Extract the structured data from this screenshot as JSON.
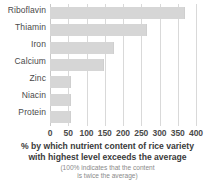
{
  "chart_data": {
    "type": "bar",
    "orientation": "horizontal",
    "title": "",
    "categories": [
      "Riboflavin",
      "Thiamin",
      "Iron",
      "Calcium",
      "Zinc",
      "Niacin",
      "Protein"
    ],
    "values": [
      370,
      265,
      175,
      148,
      58,
      58,
      58
    ],
    "xlabel": "% by which nutrient content of rice variety with highest level exceeds the average",
    "ylabel": "",
    "xlim": [
      0,
      400
    ],
    "xticks": [
      0,
      50,
      100,
      150,
      200,
      250,
      300,
      350,
      400
    ],
    "xtick_labels": [
      "0",
      "50",
      "100",
      "150",
      "200",
      "250",
      "300",
      "350",
      "400"
    ],
    "grid": "vertical",
    "legend": "none",
    "bar_color": "#d6d6d6",
    "grid_color": "#d9d9d9",
    "annotation": "(100% indicates that the content is twice the average)"
  },
  "caption": {
    "line1": "% by which nutrient content of rice variety",
    "line2": "with highest level exceeds the average",
    "note1": "(100% indicates that the content",
    "note2": "is twice the average)"
  }
}
